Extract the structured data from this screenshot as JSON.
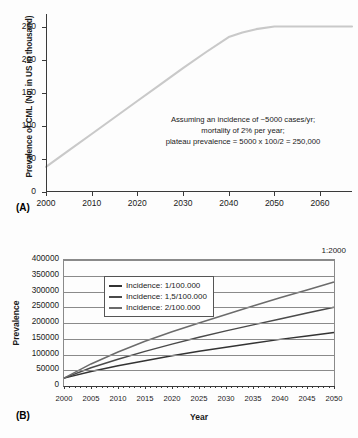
{
  "figure": {
    "panel_a_label": "(A)",
    "panel_b_label": "(B)"
  },
  "chart_data": [
    {
      "id": "panel_a",
      "type": "line",
      "title": "",
      "xlabel": "",
      "ylabel": "Prevalence of CML (No. in US in thousand)",
      "xlim": [
        2000,
        2067
      ],
      "ylim": [
        0,
        270
      ],
      "grid": false,
      "legend": "none",
      "xticks": [
        2000,
        2010,
        2020,
        2030,
        2040,
        2050,
        2060
      ],
      "yticks": [
        0,
        50,
        100,
        150,
        200,
        250
      ],
      "line_color": "#c9c9c9",
      "annotation": [
        "Assuming an incidence of ~5000 cases/yr;",
        "mortality of 2% per year;",
        "plateau prevalence = 5000 x 100/2 = 250,000"
      ],
      "x": [
        2000,
        2005,
        2010,
        2015,
        2020,
        2025,
        2030,
        2035,
        2040,
        2043,
        2046,
        2050,
        2055,
        2060,
        2067
      ],
      "values": [
        38,
        63,
        88,
        113,
        138,
        163,
        188,
        212,
        235,
        242,
        247,
        251,
        251,
        251,
        251
      ]
    },
    {
      "id": "panel_b",
      "type": "line",
      "title": "",
      "xlabel": "Year",
      "ylabel": "Prevalence",
      "annotation": "1:2000",
      "xlim": [
        2000,
        2050
      ],
      "ylim": [
        0,
        400000
      ],
      "grid": true,
      "legend": "inside-top-left",
      "xticks": [
        2000,
        2005,
        2010,
        2015,
        2020,
        2025,
        2030,
        2035,
        2040,
        2045,
        2050
      ],
      "yticks": [
        0,
        50000,
        100000,
        150000,
        200000,
        250000,
        300000,
        350000,
        400000
      ],
      "x": [
        2000,
        2005,
        2010,
        2015,
        2020,
        2025,
        2030,
        2035,
        2040,
        2045,
        2050
      ],
      "series": [
        {
          "name": "Incidence: 1/100.000",
          "color": "#333333",
          "values": [
            25000,
            46000,
            64000,
            80000,
            96000,
            110000,
            123000,
            136000,
            148000,
            159000,
            170000
          ]
        },
        {
          "name": "Incidence: 1,5/100.000",
          "color": "#4a4a4a",
          "values": [
            25000,
            58000,
            85000,
            110000,
            133000,
            155000,
            175000,
            194000,
            213000,
            232000,
            250000
          ]
        },
        {
          "name": "Incidence: 2/100.000",
          "color": "#6b6b6b",
          "values": [
            25000,
            70000,
            108000,
            142000,
            172000,
            200000,
            227000,
            254000,
            280000,
            305000,
            330000
          ]
        }
      ]
    }
  ]
}
